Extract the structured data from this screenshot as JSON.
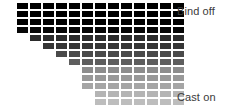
{
  "figure": {
    "type": "knitting-swatch-diagram",
    "background_color": "#ffffff",
    "width": 226,
    "height": 109
  },
  "labels": {
    "top": {
      "text": "Bind off",
      "color": "#3a3a3a",
      "x": 177,
      "y": 5
    },
    "bottom": {
      "text": "Cast on",
      "color": "#3a3a3a",
      "x": 177,
      "y": 91
    }
  },
  "chart_data": {
    "type": "heatmap",
    "title": "",
    "xlabel": "",
    "ylabel": "",
    "columns": 13,
    "rows": 13,
    "cell_width": 11,
    "cell_height": 6,
    "cell_gap_x": 2,
    "cell_gap_y": 2,
    "origin_x": 17,
    "origin_y": 3,
    "row_step_x": 13,
    "row_step_y": 8,
    "right_edge_column": 13,
    "annotations": [
      "Bind off",
      "Cast on"
    ],
    "legend": "none",
    "grid": false,
    "rows_data": [
      {
        "index": 0,
        "start_column": 0,
        "cell_count": 13,
        "color": "#000000"
      },
      {
        "index": 1,
        "start_column": 0,
        "cell_count": 13,
        "color": "#000000"
      },
      {
        "index": 2,
        "start_column": 0,
        "cell_count": 13,
        "color": "#010101"
      },
      {
        "index": 3,
        "start_column": 0,
        "cell_count": 13,
        "color": "#070707"
      },
      {
        "index": 4,
        "start_column": 1,
        "cell_count": 12,
        "color": "#2b2b2b"
      },
      {
        "index": 5,
        "start_column": 2,
        "cell_count": 11,
        "color": "#363636"
      },
      {
        "index": 6,
        "start_column": 3,
        "cell_count": 10,
        "color": "#4a4a4a"
      },
      {
        "index": 7,
        "start_column": 4,
        "cell_count": 9,
        "color": "#5e5e5e"
      },
      {
        "index": 8,
        "start_column": 5,
        "cell_count": 8,
        "color": "#8d8d8d"
      },
      {
        "index": 9,
        "start_column": 5,
        "cell_count": 8,
        "color": "#999999"
      },
      {
        "index": 10,
        "start_column": 5,
        "cell_count": 8,
        "color": "#a5a5a5"
      },
      {
        "index": 11,
        "start_column": 6,
        "cell_count": 7,
        "color": "#b4b4b4"
      },
      {
        "index": 12,
        "start_column": 6,
        "cell_count": 7,
        "color": "#bdbdbd"
      }
    ]
  }
}
